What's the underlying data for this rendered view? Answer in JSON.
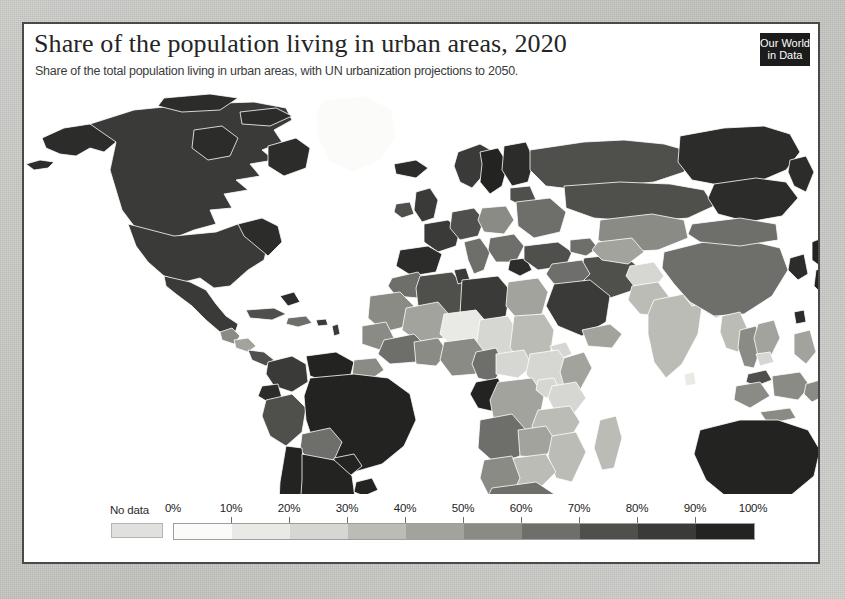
{
  "page": {
    "background_color": "#c9c9c6",
    "card_background": "#ffffff",
    "card_border_color": "#4a4a4a"
  },
  "header": {
    "title": "Share of the population living in urban areas, 2020",
    "subtitle": "Share of the total population living in urban areas, with UN urbanization projections to 2050.",
    "logo": {
      "line1": "Our World",
      "line2": "in Data",
      "background": "#1c1c1c",
      "text_color": "#ffffff"
    }
  },
  "legend": {
    "no_data_label": "No data",
    "no_data_color": "#e0e0de",
    "tick_labels": [
      "0%",
      "10%",
      "20%",
      "30%",
      "40%",
      "50%",
      "60%",
      "70%",
      "80%",
      "90%",
      "100%"
    ],
    "bin_colors": [
      "#fbfbfa",
      "#e9e9e6",
      "#d6d6d2",
      "#bcbcb7",
      "#a3a39e",
      "#8b8b86",
      "#6e6e6a",
      "#4f4f4c",
      "#3a3a38",
      "#232322"
    ]
  },
  "chart_data": {
    "type": "map",
    "projection": "equirectangular-ish world choropleth",
    "title": "Share of the population living in urban areas, 2020",
    "subtitle": "Share of the total population living in urban areas, with UN urbanization projections to 2050.",
    "unit": "%",
    "year": 2020,
    "scale": {
      "min": 0,
      "max": 100,
      "step": 10,
      "ticks": [
        0,
        10,
        20,
        30,
        40,
        50,
        60,
        70,
        80,
        90,
        100
      ],
      "no_data_color": "#e0e0de",
      "colors": [
        "#fbfbfa",
        "#e9e9e6",
        "#d6d6d2",
        "#bcbcb7",
        "#a3a39e",
        "#8b8b86",
        "#6e6e6a",
        "#4f4f4c",
        "#3a3a38",
        "#232322"
      ]
    },
    "legend_position": "bottom",
    "regions": [
      {
        "name": "Canada",
        "value": 82,
        "color": "#3a3a38"
      },
      {
        "name": "United States",
        "value": 83,
        "color": "#3a3a38"
      },
      {
        "name": "Greenland",
        "value": 87,
        "color": "#fbfbfa"
      },
      {
        "name": "Mexico",
        "value": 81,
        "color": "#3a3a38"
      },
      {
        "name": "Guatemala",
        "value": 52,
        "color": "#8b8b86"
      },
      {
        "name": "Cuba",
        "value": 77,
        "color": "#4f4f4c"
      },
      {
        "name": "Brazil",
        "value": 87,
        "color": "#232322"
      },
      {
        "name": "Argentina",
        "value": 92,
        "color": "#232322"
      },
      {
        "name": "Chile",
        "value": 88,
        "color": "#232322"
      },
      {
        "name": "Peru",
        "value": 78,
        "color": "#4f4f4c"
      },
      {
        "name": "Colombia",
        "value": 81,
        "color": "#3a3a38"
      },
      {
        "name": "Venezuela",
        "value": 88,
        "color": "#232322"
      },
      {
        "name": "Bolivia",
        "value": 70,
        "color": "#6e6e6a"
      },
      {
        "name": "Guyana",
        "value": 27,
        "color": "#d6d6d2"
      },
      {
        "name": "United Kingdom",
        "value": 84,
        "color": "#3a3a38"
      },
      {
        "name": "France",
        "value": 81,
        "color": "#3a3a38"
      },
      {
        "name": "Germany",
        "value": 77,
        "color": "#4f4f4c"
      },
      {
        "name": "Spain",
        "value": 81,
        "color": "#3a3a38"
      },
      {
        "name": "Italy",
        "value": 71,
        "color": "#6e6e6a"
      },
      {
        "name": "Poland",
        "value": 60,
        "color": "#8b8b86"
      },
      {
        "name": "Ukraine",
        "value": 70,
        "color": "#6e6e6a"
      },
      {
        "name": "Russia",
        "value": 75,
        "color": "#4f4f4c"
      },
      {
        "name": "Norway",
        "value": 83,
        "color": "#3a3a38"
      },
      {
        "name": "Sweden",
        "value": 88,
        "color": "#232322"
      },
      {
        "name": "Morocco",
        "value": 64,
        "color": "#6e6e6a"
      },
      {
        "name": "Algeria",
        "value": 74,
        "color": "#4f4f4c"
      },
      {
        "name": "Libya",
        "value": 81,
        "color": "#3a3a38"
      },
      {
        "name": "Egypt",
        "value": 43,
        "color": "#a3a39e"
      },
      {
        "name": "Sudan",
        "value": 35,
        "color": "#bcbcb7"
      },
      {
        "name": "Chad",
        "value": 24,
        "color": "#d6d6d2"
      },
      {
        "name": "Niger",
        "value": 17,
        "color": "#e9e9e6"
      },
      {
        "name": "Mali",
        "value": 44,
        "color": "#a3a39e"
      },
      {
        "name": "Nigeria",
        "value": 52,
        "color": "#8b8b86"
      },
      {
        "name": "Ethiopia",
        "value": 22,
        "color": "#d6d6d2"
      },
      {
        "name": "Kenya",
        "value": 28,
        "color": "#d6d6d2"
      },
      {
        "name": "Uganda",
        "value": 25,
        "color": "#d6d6d2"
      },
      {
        "name": "Tanzania",
        "value": 35,
        "color": "#bcbcb7"
      },
      {
        "name": "DR Congo",
        "value": 46,
        "color": "#a3a39e"
      },
      {
        "name": "Gabon",
        "value": 90,
        "color": "#232322"
      },
      {
        "name": "Angola",
        "value": 67,
        "color": "#6e6e6a"
      },
      {
        "name": "Zambia",
        "value": 45,
        "color": "#a3a39e"
      },
      {
        "name": "Zimbabwe",
        "value": 32,
        "color": "#bcbcb7"
      },
      {
        "name": "South Africa",
        "value": 67,
        "color": "#6e6e6a"
      },
      {
        "name": "Madagascar",
        "value": 39,
        "color": "#bcbcb7"
      },
      {
        "name": "Saudi Arabia",
        "value": 84,
        "color": "#3a3a38"
      },
      {
        "name": "Iran",
        "value": 76,
        "color": "#4f4f4c"
      },
      {
        "name": "Iraq",
        "value": 71,
        "color": "#6e6e6a"
      },
      {
        "name": "Turkey",
        "value": 76,
        "color": "#4f4f4c"
      },
      {
        "name": "Kazakhstan",
        "value": 58,
        "color": "#8b8b86"
      },
      {
        "name": "Afghanistan",
        "value": 26,
        "color": "#d6d6d2"
      },
      {
        "name": "Pakistan",
        "value": 37,
        "color": "#bcbcb7"
      },
      {
        "name": "India",
        "value": 35,
        "color": "#bcbcb7"
      },
      {
        "name": "Nepal",
        "value": 21,
        "color": "#d6d6d2"
      },
      {
        "name": "Bangladesh",
        "value": 38,
        "color": "#bcbcb7"
      },
      {
        "name": "Sri Lanka",
        "value": 19,
        "color": "#e9e9e6"
      },
      {
        "name": "China",
        "value": 61,
        "color": "#6e6e6a"
      },
      {
        "name": "Mongolia",
        "value": 69,
        "color": "#6e6e6a"
      },
      {
        "name": "Japan",
        "value": 92,
        "color": "#232322"
      },
      {
        "name": "South Korea",
        "value": 81,
        "color": "#232322"
      },
      {
        "name": "Myanmar",
        "value": 31,
        "color": "#bcbcb7"
      },
      {
        "name": "Thailand",
        "value": 51,
        "color": "#8b8b86"
      },
      {
        "name": "Vietnam",
        "value": 37,
        "color": "#bcbcb7"
      },
      {
        "name": "Cambodia",
        "value": 24,
        "color": "#d6d6d2"
      },
      {
        "name": "Malaysia",
        "value": 77,
        "color": "#4f4f4c"
      },
      {
        "name": "Indonesia",
        "value": 57,
        "color": "#8b8b86"
      },
      {
        "name": "Philippines",
        "value": 47,
        "color": "#a3a39e"
      },
      {
        "name": "Papua New Guinea",
        "value": 13,
        "color": "#e9e9e6"
      },
      {
        "name": "Australia",
        "value": 86,
        "color": "#232322"
      },
      {
        "name": "New Zealand",
        "value": 87,
        "color": "#232322"
      }
    ]
  }
}
